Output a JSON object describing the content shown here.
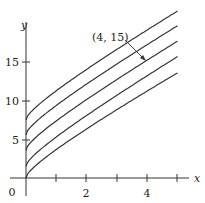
{
  "chart_data": {
    "type": "line",
    "title": "",
    "xlabel": "x",
    "ylabel": "y",
    "xlim": [
      0,
      5.3
    ],
    "ylim": [
      -0.8,
      21
    ],
    "x_ticks": [
      1,
      2,
      3,
      4,
      5
    ],
    "x_tick_labels": [
      "",
      "2",
      "",
      "4",
      ""
    ],
    "y_ticks": [
      5,
      10,
      15
    ],
    "y_tick_labels": [
      "5",
      "10",
      "15"
    ],
    "origin_label": "0",
    "grid": false,
    "legend": null,
    "series": [
      {
        "name": "curve-1",
        "x": [
          0,
          1,
          2,
          3,
          4,
          5
        ],
        "values": [
          7.5,
          11.2,
          13.8,
          16.2,
          18.7,
          21.6
        ]
      },
      {
        "name": "curve-2",
        "x": [
          0,
          1,
          2,
          3,
          4,
          5
        ],
        "values": [
          5.6,
          9.2,
          11.8,
          14.2,
          16.8,
          19.7
        ]
      },
      {
        "name": "curve-3",
        "x": [
          0,
          1,
          2,
          3,
          4,
          5
        ],
        "values": [
          3.6,
          7.2,
          9.8,
          12.3,
          15.0,
          17.7
        ]
      },
      {
        "name": "curve-4",
        "x": [
          0,
          1,
          2,
          3,
          4,
          5
        ],
        "values": [
          1.5,
          5.2,
          7.8,
          10.3,
          13.0,
          15.7
        ]
      },
      {
        "name": "curve-5",
        "x": [
          0,
          1,
          2,
          3,
          4,
          5
        ],
        "values": [
          0,
          3.2,
          5.8,
          8.3,
          11.0,
          13.6
        ]
      }
    ],
    "annotations": [
      {
        "text": "(4, 15)",
        "point": [
          4,
          15
        ],
        "arrow": true
      }
    ]
  }
}
